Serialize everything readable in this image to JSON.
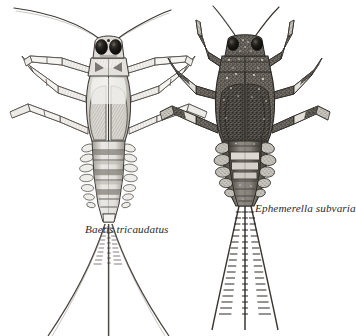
{
  "figure": {
    "kind": "scientific-illustration",
    "background_color": "#ffffff",
    "ink_color": "#2b2b2b",
    "width": 352,
    "height": 336
  },
  "specimens": [
    {
      "id": "baetis",
      "label": "Baetis tricaudatus",
      "common_note": "slender swimmer nymph",
      "label_position": {
        "x": 85,
        "y": 224
      },
      "body_tone": "pale gray, lightly hatched",
      "tail_count": 3,
      "abdominal_segments": 9,
      "gill_pairs": 7,
      "center_x": 108,
      "head_y": 42,
      "tail_tip_y": 336,
      "tones": {
        "body_light": "#e9e7e3",
        "body_mid": "#b9b6b0",
        "body_dark": "#6f6c67",
        "eye": "#15140f"
      }
    },
    {
      "id": "ephemerella",
      "label": "Ephemerella subvaria",
      "common_note": "stocky crawler nymph",
      "label_position": {
        "x": 255,
        "y": 203
      },
      "body_tone": "dark mottled with pale speckles",
      "tail_count": 3,
      "abdominal_segments": 9,
      "gill_pairs": 5,
      "center_x": 245,
      "head_y": 40,
      "tail_tip_y": 330,
      "tones": {
        "body_light": "#b4b0a9",
        "body_mid": "#7b766e",
        "body_dark": "#403c37",
        "eye": "#15140f"
      }
    }
  ]
}
